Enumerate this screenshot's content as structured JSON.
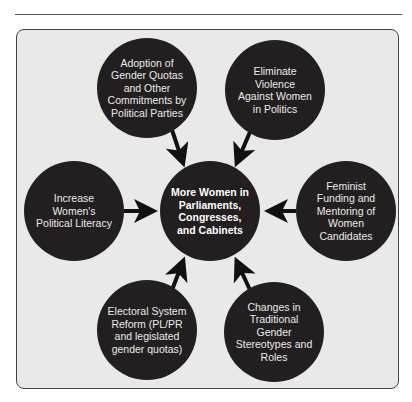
{
  "diagram": {
    "center": {
      "label": "More Women in Parliaments, Congresses, and Cabinets"
    },
    "nodes": [
      {
        "id": "top-left",
        "label": "Adoption of Gender Quotas and Other Commitments by Political Parties"
      },
      {
        "id": "top-right",
        "label": "Eliminate Violence Against Women in Politics"
      },
      {
        "id": "left",
        "label": "Increase Women's Political Literacy"
      },
      {
        "id": "right",
        "label": "Feminist Funding and Mentoring of Women Candidates"
      },
      {
        "id": "bottom-left",
        "label": "Electoral System Reform (PL/PR and legislated gender quotas)"
      },
      {
        "id": "bottom-right",
        "label": "Changes in Traditional Gender Stereotypes and Roles"
      }
    ],
    "colors": {
      "node_fill": "#231f20",
      "panel_fill": "#e9e9e9",
      "arrow": "#111111",
      "text": "#eaeaea"
    }
  }
}
